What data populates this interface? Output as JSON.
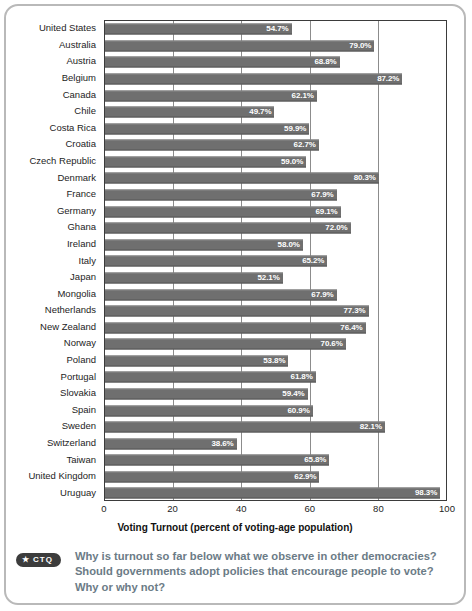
{
  "chart_data": {
    "type": "bar",
    "orientation": "horizontal",
    "title": "",
    "xlabel": "Voting Turnout (percent of voting-age population)",
    "ylabel": "",
    "xlim": [
      0,
      100
    ],
    "xticks": [
      0,
      20,
      40,
      60,
      80,
      100
    ],
    "grid": true,
    "legend": null,
    "value_suffix": "%",
    "bar_color": "#6f6f6f",
    "categories": [
      "United States",
      "Australia",
      "Austria",
      "Belgium",
      "Canada",
      "Chile",
      "Costa Rica",
      "Croatia",
      "Czech Republic",
      "Denmark",
      "France",
      "Germany",
      "Ghana",
      "Ireland",
      "Italy",
      "Japan",
      "Mongolia",
      "Netherlands",
      "New Zealand",
      "Norway",
      "Poland",
      "Portugal",
      "Slovakia",
      "Spain",
      "Sweden",
      "Switzerland",
      "Taiwan",
      "United Kingdom",
      "Uruguay"
    ],
    "values": [
      54.7,
      79.0,
      68.8,
      87.2,
      62.1,
      49.7,
      59.9,
      62.7,
      59.0,
      80.3,
      67.9,
      69.1,
      72.0,
      58.0,
      65.2,
      52.1,
      67.9,
      77.3,
      76.4,
      70.6,
      53.8,
      61.8,
      59.4,
      60.9,
      82.1,
      38.6,
      65.8,
      62.9,
      98.3
    ],
    "value_labels": [
      "54.7%",
      "79.0%",
      "68.8%",
      "87.2%",
      "62.1%",
      "49.7%",
      "59.9%",
      "62.7%",
      "59.0%",
      "80.3%",
      "67.9%",
      "69.1%",
      "72.0%",
      "58.0%",
      "65.2%",
      "52.1%",
      "67.9%",
      "77.3%",
      "76.4%",
      "70.6%",
      "53.8%",
      "61.8%",
      "59.4%",
      "60.9%",
      "82.1%",
      "38.6%",
      "65.8%",
      "62.9%",
      "98.3%"
    ]
  },
  "ctq": {
    "badge_star": "★",
    "badge_label": "CTQ",
    "text": "Why is turnout so far below what we observe in other democracies? Should governments adopt policies that encourage people to vote? Why or why not?"
  }
}
